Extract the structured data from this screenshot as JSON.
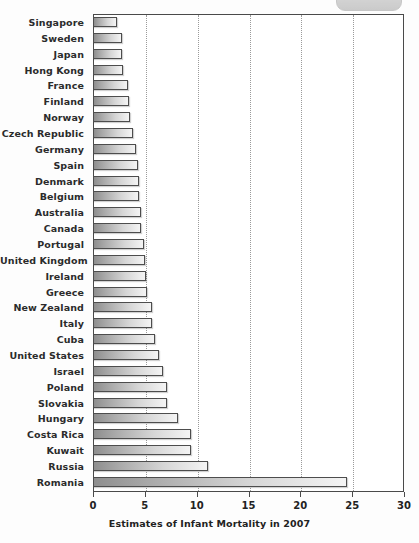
{
  "top_chrome": {
    "name": "clipped-toolbar-pill"
  },
  "chart_data": {
    "type": "bar",
    "orientation": "horizontal",
    "title": "",
    "xlabel": "Estimates of Infant Mortality in 2007",
    "ylabel": "",
    "xlim": [
      0,
      30
    ],
    "xticks": [
      0,
      5,
      10,
      15,
      20,
      25,
      30
    ],
    "xtick_labels": [
      "0",
      "5",
      "10",
      "15",
      "20",
      "25",
      "30"
    ],
    "grid": "vertical-dotted",
    "legend": null,
    "bar_color": "#b8b8b8",
    "bar_edge_color": "#4d4d4d",
    "categories": [
      "Singapore",
      "Sweden",
      "Japan",
      "Hong Kong",
      "France",
      "Finland",
      "Norway",
      "Czech Republic",
      "Germany",
      "Spain",
      "Denmark",
      "Belgium",
      "Australia",
      "Canada",
      "Portugal",
      "United Kingdom",
      "Ireland",
      "Greece",
      "New Zealand",
      "Italy",
      "Cuba",
      "United States",
      "Israel",
      "Poland",
      "Slovakia",
      "Hungary",
      "Costa Rica",
      "Kuwait",
      "Russia",
      "Romania"
    ],
    "values": [
      2.3,
      2.8,
      2.8,
      2.9,
      3.4,
      3.5,
      3.6,
      3.9,
      4.1,
      4.3,
      4.4,
      4.4,
      4.6,
      4.6,
      4.9,
      5.0,
      5.1,
      5.2,
      5.7,
      5.7,
      6.0,
      6.4,
      6.8,
      7.1,
      7.1,
      8.2,
      9.5,
      9.5,
      11.1,
      24.5
    ]
  }
}
